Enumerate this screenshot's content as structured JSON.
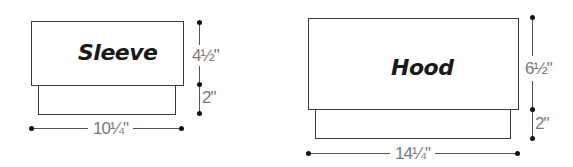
{
  "pieces": [
    {
      "name": "Sleeve",
      "dimensions": {
        "main_height": "4½\"",
        "cuff_height": "2\"",
        "width": "10¼\""
      }
    },
    {
      "name": "Hood",
      "dimensions": {
        "main_height": "6½\"",
        "band_height": "2\"",
        "width": "14¼\""
      }
    }
  ]
}
